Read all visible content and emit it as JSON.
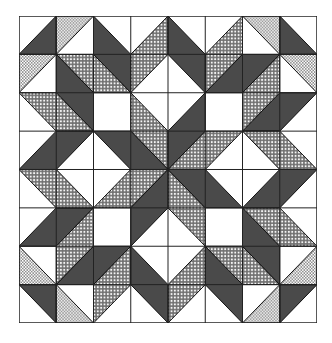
{
  "grid": {
    "cols": 8,
    "rows": 8
  },
  "colors": {
    "background": "#ffffff",
    "dark": "#4a4a4a",
    "outline": "#111111",
    "fine_dot": "#8a8a8a",
    "medium_dot": "#6e6e6e"
  },
  "symmetry": "4-fold rotational about center (4,4)",
  "quadrant_shapes": [
    {
      "fill": "dark",
      "points": [
        [
          1,
          0
        ],
        [
          1,
          1
        ],
        [
          0,
          1
        ]
      ]
    },
    {
      "fill": "fine",
      "points": [
        [
          1,
          0
        ],
        [
          2,
          0
        ],
        [
          1,
          1
        ]
      ]
    },
    {
      "fill": "dark",
      "points": [
        [
          2,
          0
        ],
        [
          3,
          1
        ],
        [
          3,
          2
        ],
        [
          2,
          1
        ]
      ]
    },
    {
      "fill": "medium",
      "points": [
        [
          3,
          1
        ],
        [
          4,
          0
        ],
        [
          4,
          1
        ],
        [
          3,
          2
        ]
      ]
    },
    {
      "fill": "fine",
      "points": [
        [
          0,
          1
        ],
        [
          1,
          1
        ],
        [
          0,
          2
        ]
      ]
    },
    {
      "fill": "medium",
      "points": [
        [
          1,
          1
        ],
        [
          2,
          1
        ],
        [
          3,
          2
        ],
        [
          2,
          2
        ]
      ]
    },
    {
      "fill": "dark",
      "points": [
        [
          1,
          1
        ],
        [
          2,
          2
        ],
        [
          2,
          3
        ],
        [
          1,
          2
        ]
      ]
    },
    {
      "fill": "medium",
      "points": [
        [
          0,
          2
        ],
        [
          1,
          2
        ],
        [
          2,
          3
        ],
        [
          1,
          3
        ]
      ]
    },
    {
      "fill": "medium",
      "points": [
        [
          3,
          2
        ],
        [
          4,
          3
        ],
        [
          4,
          4
        ],
        [
          3,
          3
        ]
      ]
    },
    {
      "fill": "dark",
      "points": [
        [
          1,
          3
        ],
        [
          2,
          3
        ],
        [
          1,
          4
        ],
        [
          0,
          4
        ]
      ]
    },
    {
      "fill": "dark",
      "points": [
        [
          2,
          3
        ],
        [
          3,
          3
        ],
        [
          4,
          4
        ],
        [
          3,
          4
        ]
      ]
    }
  ]
}
